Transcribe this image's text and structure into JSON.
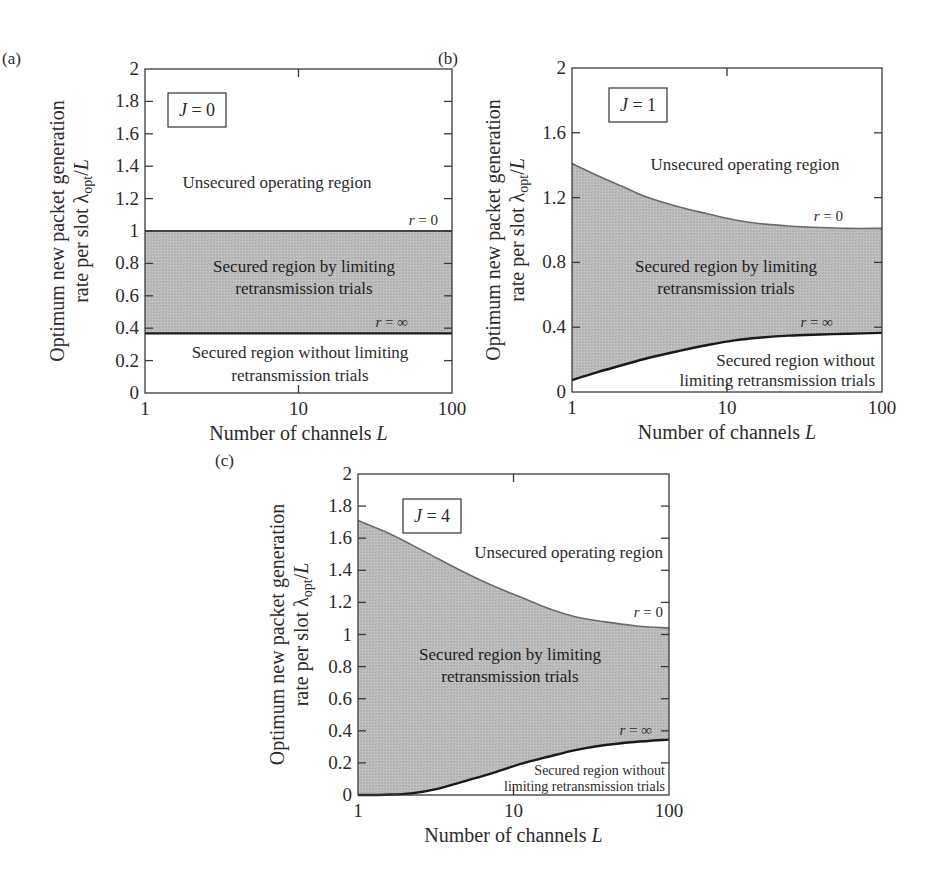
{
  "figure": {
    "fill_color": "#b9b9b9",
    "line_color": "#1a1a1a",
    "upper_line_color": "#6a6a6a",
    "frame_color": "#3a3a3a"
  },
  "chart_data": [
    {
      "type": "area",
      "panel": "(a)",
      "annotation": "J = 0",
      "title": "",
      "xlabel": "Number of channels L",
      "ylabel_line1": "Optimum new packet generation",
      "ylabel_line2": "rate per slot λopt/L",
      "xscale": "log",
      "xlim": [
        1,
        100
      ],
      "ylim": [
        0,
        2
      ],
      "xticks": [
        "1",
        "10",
        "100"
      ],
      "yticks": [
        "0",
        "0.2",
        "0.4",
        "0.6",
        "0.8",
        "1",
        "1.2",
        "1.4",
        "1.6",
        "1.8",
        "2"
      ],
      "grid": false,
      "series": [
        {
          "name": "r = 0",
          "x": [
            1,
            2,
            5,
            10,
            20,
            50,
            100
          ],
          "values": [
            1.0,
            1.0,
            1.0,
            1.0,
            1.0,
            1.0,
            1.0
          ]
        },
        {
          "name": "r = ∞",
          "x": [
            1,
            2,
            5,
            10,
            20,
            50,
            100
          ],
          "values": [
            0.368,
            0.368,
            0.368,
            0.368,
            0.368,
            0.368,
            0.368
          ]
        }
      ],
      "regions": [
        "Unsecured operating region",
        "Secured region by limiting retransmission trials",
        "Secured region without limiting retransmission trials"
      ],
      "labels": {
        "unsecured": "Unsecured operating region",
        "secured_limit_1": "Secured region by limiting",
        "secured_limit_2": "retransmission trials",
        "secured_nolimit_1": "Secured region without limiting",
        "secured_nolimit_2": "retransmission trials",
        "r0": "r = 0",
        "rinf": "r = ∞"
      }
    },
    {
      "type": "area",
      "panel": "(b)",
      "annotation": "J = 1",
      "title": "",
      "xlabel": "Number of channels L",
      "ylabel_line1": "Optimum new packet generation",
      "ylabel_line2": "rate per slot λopt/L",
      "xscale": "log",
      "xlim": [
        1,
        100
      ],
      "ylim": [
        0,
        2
      ],
      "xticks": [
        "1",
        "10",
        "100"
      ],
      "yticks": [
        "0",
        "0.4",
        "0.8",
        "1.2",
        "1.6",
        "2"
      ],
      "grid": false,
      "series": [
        {
          "name": "r = 0",
          "x": [
            1,
            1.43,
            2.1,
            3.1,
            5.0,
            7.5,
            11.5,
            16,
            25,
            40,
            60,
            100
          ],
          "values": [
            1.41,
            1.34,
            1.27,
            1.2,
            1.14,
            1.1,
            1.06,
            1.04,
            1.025,
            1.015,
            1.01,
            1.01
          ]
        },
        {
          "name": "r = ∞",
          "x": [
            1,
            1.43,
            2.1,
            3.1,
            5.0,
            7.5,
            11.5,
            16,
            25,
            40,
            60,
            100
          ],
          "values": [
            0.074,
            0.12,
            0.165,
            0.21,
            0.255,
            0.29,
            0.32,
            0.335,
            0.348,
            0.355,
            0.36,
            0.365
          ]
        }
      ],
      "regions": [
        "Unsecured operating region",
        "Secured region by limiting retransmission trials",
        "Secured region without limiting retransmission trials"
      ],
      "labels": {
        "unsecured": "Unsecured operating region",
        "secured_limit_1": "Secured region by limiting",
        "secured_limit_2": "retransmission trials",
        "secured_nolimit_1": "Secured region without",
        "secured_nolimit_2": "limiting retransmission trials",
        "r0": "r = 0",
        "rinf": "r = ∞"
      }
    },
    {
      "type": "area",
      "panel": "(c)",
      "annotation": "J = 4",
      "title": "",
      "xlabel": "Number of channels L",
      "ylabel_line1": "Optimum new packet generation",
      "ylabel_line2": "rate per slot λopt/L",
      "xscale": "log",
      "xlim": [
        1,
        100
      ],
      "ylim": [
        0,
        2
      ],
      "xticks": [
        "1",
        "10",
        "100"
      ],
      "yticks": [
        "0",
        "0.2",
        "0.4",
        "0.6",
        "0.8",
        "1",
        "1.2",
        "1.4",
        "1.6",
        "1.8",
        "2"
      ],
      "grid": false,
      "series": [
        {
          "name": "r = 0",
          "x": [
            1,
            1.5,
            2.2,
            3.3,
            5.0,
            7.5,
            11.3,
            17,
            25,
            38,
            60,
            100
          ],
          "values": [
            1.71,
            1.64,
            1.56,
            1.47,
            1.38,
            1.3,
            1.23,
            1.16,
            1.11,
            1.08,
            1.055,
            1.04
          ]
        },
        {
          "name": "r = ∞",
          "x": [
            1,
            1.5,
            2.2,
            3.3,
            5.0,
            7.5,
            11.3,
            17,
            25,
            38,
            60,
            100
          ],
          "values": [
            0.0,
            0.002,
            0.01,
            0.04,
            0.09,
            0.14,
            0.195,
            0.24,
            0.28,
            0.31,
            0.33,
            0.345
          ]
        }
      ],
      "regions": [
        "Unsecured operating region",
        "Secured region by limiting retransmission trials",
        "Secured region without limiting retransmission trials"
      ],
      "labels": {
        "unsecured": "Unsecured operating region",
        "secured_limit_1": "Secured region by limiting",
        "secured_limit_2": "retransmission trials",
        "secured_nolimit_1": "Secured region without",
        "secured_nolimit_2": "limiting retransmission trials",
        "r0": "r = 0",
        "rinf": "r = ∞"
      }
    }
  ]
}
